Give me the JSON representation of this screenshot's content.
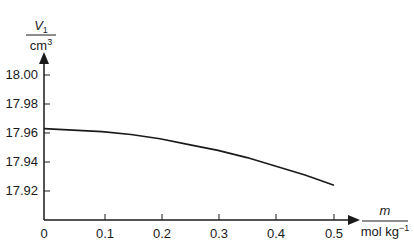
{
  "chart_data": {
    "type": "line",
    "title": "",
    "xlabel": {
      "numerator": "m",
      "denominator": "mol kg",
      "denominator_sup": "−1"
    },
    "ylabel": {
      "numerator": "V",
      "numerator_sub": "1",
      "denominator": "cm",
      "denominator_sup": "3"
    },
    "xlim": [
      0,
      0.5
    ],
    "ylim": [
      17.9,
      18.0
    ],
    "x_ticks": [
      "0",
      "0.1",
      "0.2",
      "0.3",
      "0.4",
      "0.5"
    ],
    "y_ticks": [
      "18.00",
      "17.98",
      "17.96",
      "17.94",
      "17.92"
    ],
    "grid": false,
    "legend": null,
    "series": [
      {
        "name": "V1",
        "x": [
          0,
          0.05,
          0.1,
          0.15,
          0.2,
          0.25,
          0.3,
          0.35,
          0.4,
          0.45,
          0.5
        ],
        "values": [
          17.963,
          17.962,
          17.961,
          17.959,
          17.956,
          17.952,
          17.948,
          17.943,
          17.937,
          17.931,
          17.924
        ]
      }
    ]
  }
}
